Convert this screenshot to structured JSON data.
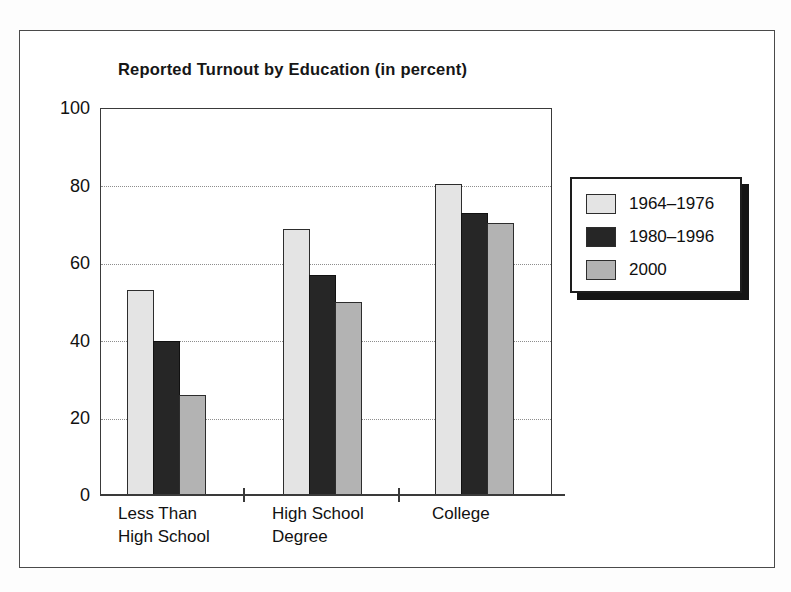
{
  "chart_data": {
    "type": "bar",
    "title": "Reported Turnout by Education (in percent)",
    "xlabel": "",
    "ylabel": "",
    "ylim": [
      0,
      100
    ],
    "yticks": [
      0,
      20,
      40,
      60,
      80,
      100
    ],
    "grid": "horizontal-dotted",
    "legend_position": "right",
    "categories": [
      "Less Than\nHigh School",
      "High School\nDegree",
      "College"
    ],
    "series": [
      {
        "name": "1964–1976",
        "color": "#e4e4e4",
        "values": [
          53,
          69,
          80.5
        ]
      },
      {
        "name": "1980–1996",
        "color": "#262626",
        "values": [
          40,
          57,
          73
        ]
      },
      {
        "name": "2000",
        "color": "#b3b3b3",
        "values": [
          26,
          50,
          70.5
        ]
      }
    ]
  },
  "axis": {
    "tick_labels": [
      "100",
      "80",
      "60",
      "40",
      "20",
      "0"
    ]
  },
  "legend": {
    "entries": [
      {
        "label": "1964–1976"
      },
      {
        "label": "1980–1996"
      },
      {
        "label": "2000"
      }
    ]
  }
}
